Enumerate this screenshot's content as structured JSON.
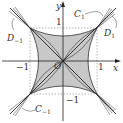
{
  "diagram": {
    "axes": {
      "x_label": "x",
      "y_label": "y",
      "origin_label": "O"
    },
    "ticks": {
      "x_pos": "1",
      "x_neg": "−1",
      "y_pos": "1",
      "y_neg": "−1"
    },
    "curves": {
      "c1": {
        "name": "C",
        "sub": "1"
      },
      "c_neg1": {
        "name": "C",
        "sub": "−1"
      },
      "d1": {
        "name": "D",
        "sub": "1"
      },
      "d_neg1": {
        "name": "D",
        "sub": "−1"
      }
    },
    "colors": {
      "shade": "#c8c8c8",
      "line": "#222222",
      "dash": "#999999"
    }
  }
}
